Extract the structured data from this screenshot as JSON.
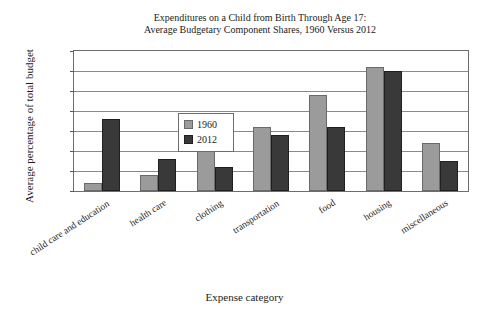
{
  "chart_data": {
    "type": "bar",
    "title": "Expenditures on a Child from Birth Through Age 17: Average Budgetary Component Shares, 1960 Versus 2012",
    "title_line1": "Expenditures on a Child from Birth Through Age 17:",
    "title_line2": "Average Budgetary Component Shares, 1960 Versus 2012",
    "xlabel": "Expense category",
    "ylabel": "Average percentage of total budget",
    "ylim": [
      0,
      35
    ],
    "ytick_step": 5,
    "yticks": [
      "0",
      "5",
      "10",
      "15",
      "20",
      "25",
      "30",
      "35"
    ],
    "grid": true,
    "legend_position": "upper-left-inside",
    "categories": [
      "child care and education",
      "health care",
      "clothing",
      "transportation",
      "food",
      "housing",
      "miscellaneous"
    ],
    "series": [
      {
        "name": "1960",
        "color": "#9b9b9b",
        "values": [
          2,
          4,
          11,
          16,
          24,
          31,
          12
        ]
      },
      {
        "name": "2012",
        "color": "#393939",
        "values": [
          18,
          8,
          6,
          14,
          16,
          30,
          7.5
        ]
      }
    ]
  },
  "legend": {
    "items": [
      {
        "label": "1960"
      },
      {
        "label": "2012"
      }
    ]
  }
}
